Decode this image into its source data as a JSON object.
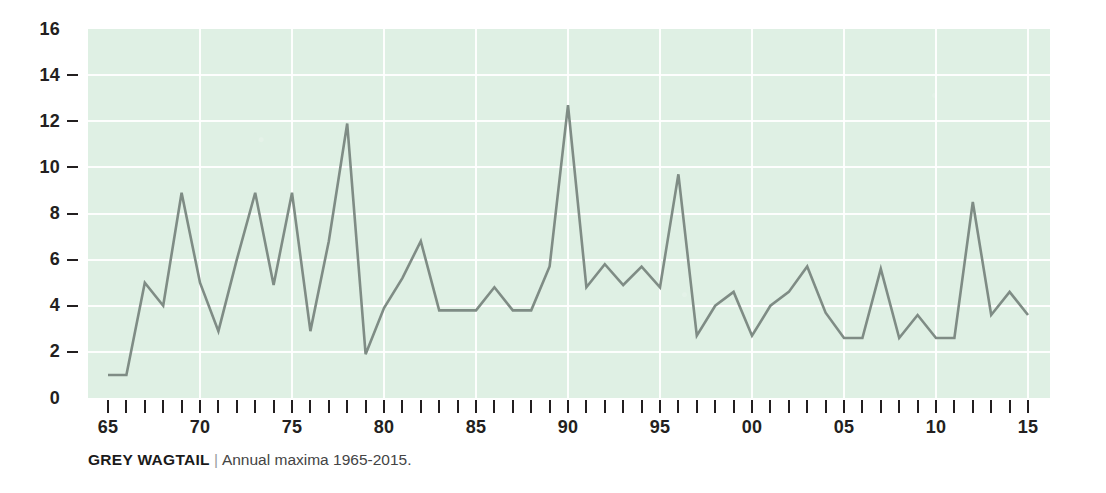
{
  "caption": {
    "title": "GREY WAGTAIL",
    "separator": "|",
    "subtitle": "Annual maxima 1965-2015."
  },
  "chart_data": {
    "type": "line",
    "title": "GREY WAGTAIL",
    "subtitle": "Annual maxima 1965-2015.",
    "xlabel": "",
    "ylabel": "",
    "xlim": [
      1965,
      2015
    ],
    "ylim": [
      0,
      16
    ],
    "y_ticks": [
      0,
      2,
      4,
      6,
      8,
      10,
      12,
      14,
      16
    ],
    "y_tick_labels": [
      "0",
      "2",
      "4",
      "6",
      "8",
      "10",
      "12",
      "14",
      "16"
    ],
    "x_tick_labels": [
      "65",
      "70",
      "75",
      "80",
      "85",
      "90",
      "95",
      "00",
      "05",
      "10",
      "15"
    ],
    "x_labeled_years": [
      1965,
      1970,
      1975,
      1980,
      1985,
      1990,
      1995,
      2000,
      2005,
      2010,
      2015
    ],
    "x_minor_tick_every": 1,
    "grid": true,
    "grid_color": "#ffffff",
    "plot_background": "#dff0e4",
    "line_color": "#7f8c85",
    "legend": "none",
    "x": [
      1965,
      1966,
      1967,
      1968,
      1969,
      1970,
      1971,
      1972,
      1973,
      1974,
      1975,
      1976,
      1977,
      1978,
      1979,
      1980,
      1981,
      1982,
      1983,
      1984,
      1985,
      1986,
      1987,
      1988,
      1989,
      1990,
      1991,
      1992,
      1993,
      1994,
      1995,
      1996,
      1997,
      1998,
      1999,
      2000,
      2001,
      2002,
      2003,
      2004,
      2005,
      2006,
      2007,
      2008,
      2009,
      2010,
      2011,
      2012,
      2013,
      2014,
      2015
    ],
    "values": [
      1.0,
      1.0,
      5.0,
      4.0,
      8.9,
      5.0,
      2.9,
      6.0,
      8.9,
      4.9,
      8.9,
      2.9,
      6.8,
      11.9,
      1.9,
      3.9,
      5.2,
      6.8,
      3.8,
      3.8,
      3.8,
      4.8,
      3.8,
      3.8,
      5.7,
      12.7,
      4.8,
      5.8,
      4.9,
      5.7,
      4.8,
      9.7,
      2.7,
      4.0,
      4.6,
      2.7,
      4.0,
      4.6,
      5.7,
      3.7,
      2.6,
      2.6,
      5.6,
      2.6,
      3.6,
      2.6,
      2.6,
      8.5,
      3.6,
      4.6,
      3.6
    ],
    "series": [
      {
        "name": "Grey Wagtail annual maxima",
        "values": [
          1.0,
          1.0,
          5.0,
          4.0,
          8.9,
          5.0,
          2.9,
          6.0,
          8.9,
          4.9,
          8.9,
          2.9,
          6.8,
          11.9,
          1.9,
          3.9,
          5.2,
          6.8,
          3.8,
          3.8,
          3.8,
          4.8,
          3.8,
          3.8,
          5.7,
          12.7,
          4.8,
          5.8,
          4.9,
          5.7,
          4.8,
          9.7,
          2.7,
          4.0,
          4.6,
          2.7,
          4.0,
          4.6,
          5.7,
          3.7,
          2.6,
          2.6,
          5.6,
          2.6,
          3.6,
          2.6,
          2.6,
          8.5,
          3.6,
          4.6,
          3.6
        ]
      }
    ]
  }
}
